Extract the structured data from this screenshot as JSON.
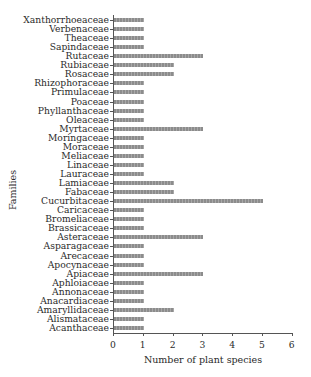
{
  "chart_data": {
    "type": "bar",
    "orientation": "horizontal",
    "title": "",
    "xlabel": "Number of plant species",
    "ylabel": "Families",
    "xlim": [
      0,
      6
    ],
    "xticks": [
      "0",
      "1",
      "2",
      "3",
      "4",
      "5",
      "6"
    ],
    "grid": false,
    "legend": null,
    "categories": [
      "Xanthorrhoeaceae",
      "Verbenaceae",
      "Theaceae",
      "Sapindaceae",
      "Rutaceae",
      "Rubiaceae",
      "Rosaceae",
      "Rhizophoraceae",
      "Primulaceae",
      "Poaceae",
      "Phyllanthaceae",
      "Oleaceae",
      "Myrtaceae",
      "Moringaceae",
      "Moraceae",
      "Meliaceae",
      "Linaceae",
      "Lauraceae",
      "Lamiaceae",
      "Fabaceae",
      "Cucurbitaceae",
      "Caricaceae",
      "Bromeliaceae",
      "Brassicaceae",
      "Asteraceae",
      "Asparagaceae",
      "Arecaceae",
      "Apocynaceae",
      "Apiaceae",
      "Aphloiaceae",
      "Annonaceae",
      "Anacardiaceae",
      "Amaryllidaceae",
      "Alismataceae",
      "Acanthaceae"
    ],
    "values": [
      1,
      1,
      1,
      1,
      3,
      2,
      2,
      1,
      1,
      1,
      1,
      1,
      3,
      1,
      1,
      1,
      1,
      1,
      2,
      2,
      5,
      1,
      1,
      1,
      3,
      1,
      1,
      1,
      3,
      1,
      1,
      1,
      2,
      1,
      1
    ],
    "bar_color": "#999999"
  }
}
